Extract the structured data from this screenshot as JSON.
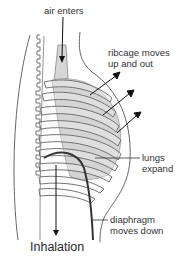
{
  "diagram": {
    "title": "Inhalation",
    "labels": {
      "air_enters": "air enters",
      "ribcage_line1": "ribcage moves",
      "ribcage_line2": "up and out",
      "lungs_line1": "lungs",
      "lungs_line2": "expand",
      "diaphragm_line1": "diaphragm",
      "diaphragm_line2": "moves down"
    },
    "colors": {
      "outline": "#555555",
      "lung_fill": "#d4d4d4",
      "rib_fill": "#f4f4f4",
      "arrow": "#111111",
      "diaphragm": "#333333"
    },
    "icons": {
      "air_arrow": "arrow-down",
      "ribcage_arrows": "arrow-up-right",
      "diaphragm_arrow": "arrow-down"
    }
  }
}
